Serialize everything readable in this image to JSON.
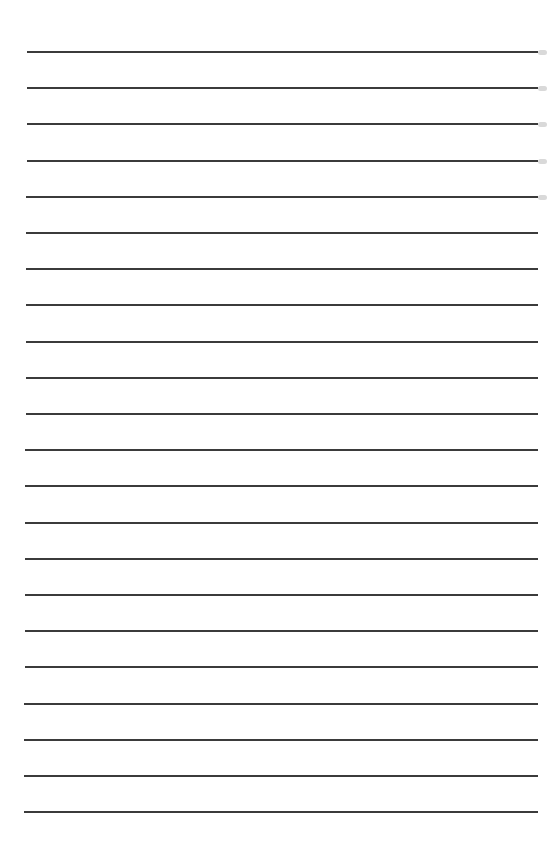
{
  "page": {
    "type": "lined-paper",
    "background_color": "#ffffff",
    "line_color": "#2a2a2a",
    "line_count": 22,
    "first_line_y": 52,
    "line_spacing": 36.2,
    "line_left_start": 27,
    "line_left_end": 24,
    "line_right": 538,
    "edge_smudges_on_lines": [
      0,
      1,
      2,
      3,
      4
    ],
    "text": ""
  }
}
